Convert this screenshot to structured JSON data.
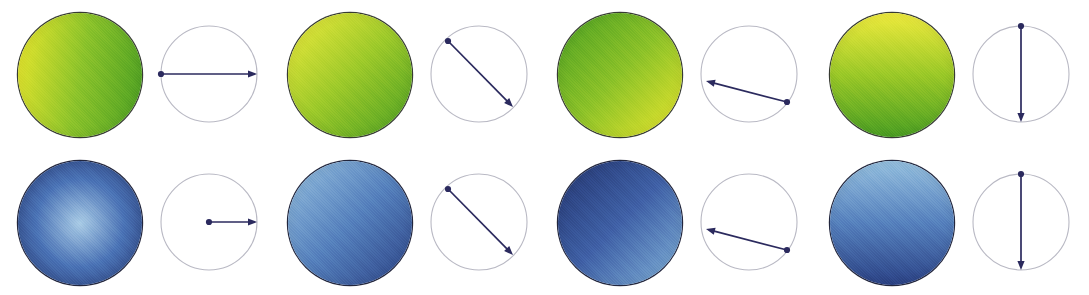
{
  "figure": {
    "width": 1089,
    "height": 295,
    "background_color": "#ffffff",
    "rows": [
      {
        "id": "row-top",
        "label": "green-yellow spheres"
      },
      {
        "id": "row-bottom",
        "label": "blue spheres"
      }
    ],
    "colors": {
      "green": "#4a9e22",
      "green_dark": "#3f8c1c",
      "yellow": "#e8e52a",
      "yellow_light": "#eeea3c",
      "blue_light": "#93bede",
      "blue_mid": "#4a72b5",
      "blue_dark": "#23356f",
      "blue_darkest": "#1b2a5e",
      "arrow": "#2b2a5e",
      "circle_outline": "#b9b9c4",
      "sphere_outline": "#14190f"
    },
    "panels": [
      {
        "id": "panel-1",
        "index": 1,
        "x": 0,
        "top": {
          "sphere": {
            "name": "green-sphere-1",
            "gradient_type": "linear",
            "gradient_angle_deg": 100,
            "gradient_description": "yellow at left / lower-left to green at right",
            "stops": [
              "#e9e62c",
              "#8bc32a",
              "#4a9e22"
            ]
          },
          "diagram": {
            "name": "vector-diagram-1-top",
            "circle_radius": 48,
            "arrow_start": {
              "x": 4,
              "y": 55
            },
            "arrow_end": {
              "x": 100,
              "y": 55
            },
            "arrow_angle_deg": 0,
            "arrow_length_relative": "diameter",
            "dot_at_start": true,
            "description": "horizontal arrow spanning full diameter, pointing right"
          }
        },
        "bottom": {
          "sphere": {
            "name": "blue-sphere-1",
            "gradient_type": "radial",
            "gradient_center": "50% 50%",
            "gradient_description": "light blue highlight in the centre fading to dark navy at edge",
            "stops": [
              "#a8cbe6",
              "#4a72b5",
              "#23356f"
            ]
          },
          "diagram": {
            "name": "vector-diagram-1-bottom",
            "circle_radius": 48,
            "arrow_start": {
              "x": 52,
              "y": 55
            },
            "arrow_end": {
              "x": 100,
              "y": 55
            },
            "arrow_angle_deg": 0,
            "arrow_length_relative": "radius",
            "dot_at_start": true,
            "description": "horizontal arrow from centre to right edge, pointing right"
          }
        }
      },
      {
        "id": "panel-2",
        "index": 2,
        "x": 270,
        "top": {
          "sphere": {
            "name": "green-sphere-2",
            "gradient_type": "linear",
            "gradient_angle_deg": 135,
            "gradient_description": "yellow at upper-left to green at lower-right",
            "stops": [
              "#eeea3c",
              "#9cc929",
              "#4a9e22"
            ]
          },
          "diagram": {
            "name": "vector-diagram-2-top",
            "circle_radius": 48,
            "arrow_start": {
              "x": 21,
              "y": 22
            },
            "arrow_end": {
              "x": 86,
              "y": 88
            },
            "arrow_angle_deg": 45,
            "arrow_length_relative": "diameter",
            "dot_at_start": true,
            "description": "diagonal arrow from upper-left to lower-right"
          }
        },
        "bottom": {
          "sphere": {
            "name": "blue-sphere-2",
            "gradient_type": "linear",
            "gradient_angle_deg": 135,
            "gradient_description": "light blue at upper-left to dark navy at lower-right",
            "stops": [
              "#93bede",
              "#5580bd",
              "#2b4285"
            ]
          },
          "diagram": {
            "name": "vector-diagram-2-bottom",
            "circle_radius": 48,
            "arrow_start": {
              "x": 21,
              "y": 22
            },
            "arrow_end": {
              "x": 86,
              "y": 88
            },
            "arrow_angle_deg": 45,
            "arrow_length_relative": "diameter",
            "dot_at_start": true,
            "description": "diagonal arrow from upper-left to lower-right"
          }
        }
      },
      {
        "id": "panel-3",
        "index": 3,
        "x": 540,
        "top": {
          "sphere": {
            "name": "green-sphere-3",
            "gradient_type": "linear",
            "gradient_angle_deg": 135,
            "gradient_description": "green at upper-left to yellow at lower-right",
            "stops": [
              "#4a9e22",
              "#8cc228",
              "#e9e62c"
            ]
          },
          "diagram": {
            "name": "vector-diagram-3-top",
            "circle_radius": 48,
            "arrow_start": {
              "x": 90,
              "y": 83
            },
            "arrow_end": {
              "x": 9,
              "y": 62
            },
            "arrow_angle_deg": 195,
            "arrow_length_relative": "chord",
            "dot_at_start": true,
            "description": "shallow arrow from lower-right to left, pointing left and slightly up"
          }
        },
        "bottom": {
          "sphere": {
            "name": "blue-sphere-3",
            "gradient_type": "linear",
            "gradient_angle_deg": 315,
            "gradient_description": "dark navy at upper-left to lighter blue at lower-right",
            "stops": [
              "#7fb0d8",
              "#3f60a6",
              "#23356f"
            ]
          },
          "diagram": {
            "name": "vector-diagram-3-bottom",
            "circle_radius": 48,
            "arrow_start": {
              "x": 90,
              "y": 83
            },
            "arrow_end": {
              "x": 9,
              "y": 62
            },
            "arrow_angle_deg": 195,
            "arrow_length_relative": "chord",
            "dot_at_start": true,
            "description": "shallow arrow from lower-right to left, pointing left and slightly up"
          }
        }
      },
      {
        "id": "panel-4",
        "index": 4,
        "x": 812,
        "top": {
          "sphere": {
            "name": "green-sphere-4",
            "gradient_type": "linear",
            "gradient_angle_deg": 180,
            "gradient_description": "yellow at top to green at bottom",
            "stops": [
              "#eeea3c",
              "#9ac827",
              "#4a9e22"
            ]
          },
          "diagram": {
            "name": "vector-diagram-4-top",
            "circle_radius": 48,
            "arrow_start": {
              "x": 52,
              "y": 7
            },
            "arrow_end": {
              "x": 52,
              "y": 103
            },
            "arrow_angle_deg": 90,
            "arrow_length_relative": "diameter",
            "dot_at_start": true,
            "description": "vertical arrow from top edge to bottom edge, pointing down"
          }
        },
        "bottom": {
          "sphere": {
            "name": "blue-sphere-4",
            "gradient_type": "linear",
            "gradient_angle_deg": 180,
            "gradient_description": "light blue at top to dark navy at bottom",
            "stops": [
              "#93bede",
              "#5580bd",
              "#2b4285"
            ]
          },
          "diagram": {
            "name": "vector-diagram-4-bottom",
            "circle_radius": 48,
            "arrow_start": {
              "x": 52,
              "y": 7
            },
            "arrow_end": {
              "x": 52,
              "y": 103
            },
            "arrow_angle_deg": 90,
            "arrow_length_relative": "diameter",
            "dot_at_start": true,
            "description": "vertical arrow from top edge to bottom edge, pointing down"
          }
        }
      }
    ]
  }
}
